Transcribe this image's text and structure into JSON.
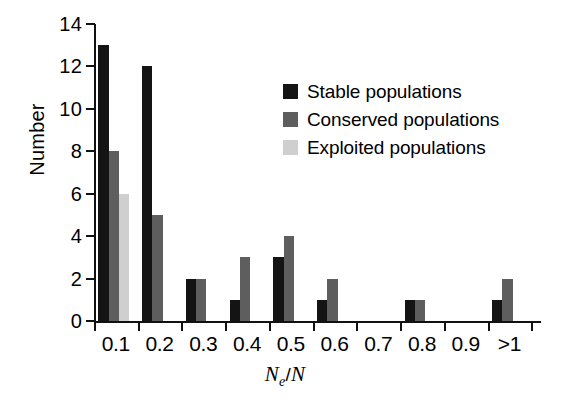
{
  "chart_data": {
    "type": "bar",
    "title": "",
    "subtitle": "",
    "xlabel": "Ne / N",
    "xlabel_parts": {
      "symbol": "N",
      "subscript": "e",
      "separator": "/",
      "denominator": "N"
    },
    "ylabel": "Number",
    "categories": [
      "0.1",
      "0.2",
      "0.3",
      "0.4",
      "0.5",
      "0.6",
      "0.7",
      "0.8",
      "0.9",
      ">1"
    ],
    "series": [
      {
        "name": "Stable populations",
        "color": "#141414",
        "values": [
          13,
          12,
          2,
          1,
          3,
          1,
          0,
          1,
          0,
          1
        ]
      },
      {
        "name": "Conserved populations",
        "color": "#5e5e5e",
        "values": [
          8,
          5,
          2,
          3,
          4,
          2,
          0,
          1,
          0,
          2
        ]
      },
      {
        "name": "Exploited populations",
        "color": "#cfcfcf",
        "values": [
          6,
          0,
          0,
          0,
          0,
          0,
          0,
          0,
          0,
          0
        ]
      }
    ],
    "ylim": [
      0,
      14
    ],
    "yticks": [
      0,
      2,
      4,
      6,
      8,
      10,
      12,
      14
    ],
    "ytick_labels": [
      "0",
      "2",
      "4",
      "6",
      "8",
      "10",
      "12",
      "14"
    ],
    "grid": false,
    "legend_position": "upper-right-inside"
  },
  "legend": {
    "entries": [
      {
        "label": "Stable populations"
      },
      {
        "label": "Conserved populations"
      },
      {
        "label": "Exploited populations"
      }
    ]
  },
  "axes": {
    "y_title": "Number",
    "x_title": "Ne / N"
  }
}
